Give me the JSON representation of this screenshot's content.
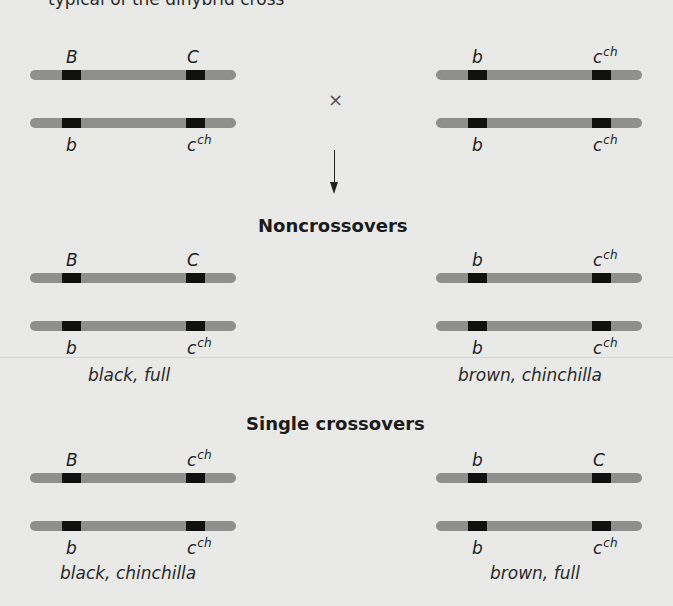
{
  "header": {
    "cut_text": "typical of the dihybrid cross"
  },
  "parents": {
    "left": {
      "top": {
        "g1": "B",
        "g1_sup": "",
        "g2": "C",
        "g2_sup": ""
      },
      "bottom": {
        "g1": "b",
        "g1_sup": "",
        "g2": "c",
        "g2_sup": "ch"
      }
    },
    "right": {
      "top": {
        "g1": "b",
        "g1_sup": "",
        "g2": "c",
        "g2_sup": "ch"
      },
      "bottom": {
        "g1": "b",
        "g1_sup": "",
        "g2": "c",
        "g2_sup": "ch"
      }
    },
    "cross_symbol": "×"
  },
  "noncrossovers": {
    "title": "Noncrossovers",
    "left": {
      "top": {
        "g1": "B",
        "g1_sup": "",
        "g2": "C",
        "g2_sup": ""
      },
      "bottom": {
        "g1": "b",
        "g1_sup": "",
        "g2": "c",
        "g2_sup": "ch"
      },
      "phenotype": "black, full"
    },
    "right": {
      "top": {
        "g1": "b",
        "g1_sup": "",
        "g2": "c",
        "g2_sup": "ch"
      },
      "bottom": {
        "g1": "b",
        "g1_sup": "",
        "g2": "c",
        "g2_sup": "ch"
      },
      "phenotype": "brown, chinchilla"
    }
  },
  "single_crossovers": {
    "title": "Single crossovers",
    "left": {
      "top": {
        "g1": "B",
        "g1_sup": "",
        "g2": "c",
        "g2_sup": "ch"
      },
      "bottom": {
        "g1": "b",
        "g1_sup": "",
        "g2": "c",
        "g2_sup": "ch"
      },
      "phenotype": "black, chinchilla"
    },
    "right": {
      "top": {
        "g1": "b",
        "g1_sup": "",
        "g2": "C",
        "g2_sup": ""
      },
      "bottom": {
        "g1": "b",
        "g1_sup": "",
        "g2": "c",
        "g2_sup": "ch"
      },
      "phenotype": "brown, full"
    }
  },
  "colors": {
    "background": "#e9e9e7",
    "chromosome": "#8f8f8f",
    "band": "#111111"
  }
}
